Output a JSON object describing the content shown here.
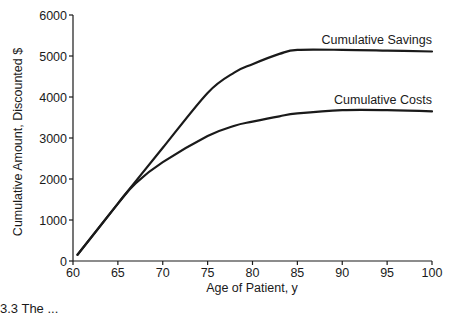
{
  "chart_data": {
    "type": "line",
    "title": "",
    "xlabel": "Age of Patient, y",
    "ylabel": "Cumulative Amount, Discounted $",
    "xlim": [
      60,
      100
    ],
    "ylim": [
      0,
      6000
    ],
    "x_ticks": [
      60,
      65,
      70,
      75,
      80,
      85,
      90,
      95,
      100
    ],
    "y_ticks": [
      0,
      1000,
      2000,
      3000,
      4000,
      5000,
      6000
    ],
    "grid": false,
    "legend": "inline labels at right end of each curve",
    "x": [
      60.5,
      65,
      67,
      70,
      75,
      78,
      80,
      83,
      85,
      90,
      95,
      100
    ],
    "series": [
      {
        "name": "Cumulative Savings",
        "values": [
          150,
          1400,
          1950,
          2760,
          4100,
          4600,
          4800,
          5050,
          5150,
          5150,
          5130,
          5110
        ]
      },
      {
        "name": "Cumulative Costs",
        "values": [
          150,
          1400,
          1900,
          2410,
          3050,
          3300,
          3400,
          3530,
          3600,
          3680,
          3680,
          3650
        ]
      }
    ],
    "color": "#1a1a1a"
  },
  "caption_partial": "3.3  The ..."
}
